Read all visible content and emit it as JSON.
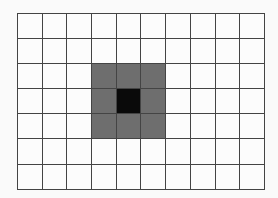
{
  "grid": {
    "rows": 7,
    "cols": 10,
    "colors": {
      "empty": "#fcfcfc",
      "gray": "#6e6e6e",
      "black": "#0a0a0a",
      "line": "#444444"
    },
    "cells": [
      [
        "empty",
        "empty",
        "empty",
        "empty",
        "empty",
        "empty",
        "empty",
        "empty",
        "empty",
        "empty"
      ],
      [
        "empty",
        "empty",
        "empty",
        "empty",
        "empty",
        "empty",
        "empty",
        "empty",
        "empty",
        "empty"
      ],
      [
        "empty",
        "empty",
        "empty",
        "gray",
        "gray",
        "gray",
        "empty",
        "empty",
        "empty",
        "empty"
      ],
      [
        "empty",
        "empty",
        "empty",
        "gray",
        "black",
        "gray",
        "empty",
        "empty",
        "empty",
        "empty"
      ],
      [
        "empty",
        "empty",
        "empty",
        "gray",
        "gray",
        "gray",
        "empty",
        "empty",
        "empty",
        "empty"
      ],
      [
        "empty",
        "empty",
        "empty",
        "empty",
        "empty",
        "empty",
        "empty",
        "empty",
        "empty",
        "empty"
      ],
      [
        "empty",
        "empty",
        "empty",
        "empty",
        "empty",
        "empty",
        "empty",
        "empty",
        "empty",
        "empty"
      ]
    ]
  }
}
